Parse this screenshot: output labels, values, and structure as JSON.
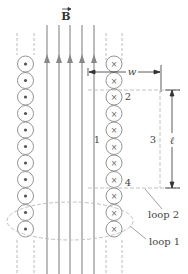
{
  "diagram": {
    "field_label": "B",
    "width_label": "w",
    "length_label": "ℓ",
    "side_labels": [
      "1",
      "2",
      "3",
      "4"
    ],
    "loop_labels": [
      "loop 1",
      "loop 2"
    ],
    "left_column": {
      "count": 11,
      "symbol": "dot",
      "meaning": "current out of page"
    },
    "right_column": {
      "count": 11,
      "symbol": "cross",
      "meaning": "current into page"
    },
    "field_lines": 5,
    "colors": {
      "line": "#999999",
      "dash": "#bbbbbb",
      "text": "#444444"
    }
  }
}
